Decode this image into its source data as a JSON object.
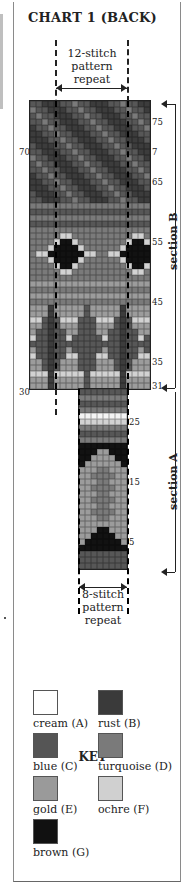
{
  "title": "CHART 1 (BACK)",
  "repeat_top": {
    "line1": "12-stitch",
    "line2": "pattern",
    "line3": "repeat"
  },
  "repeat_bottom": {
    "line1": "8-stitch",
    "line2": "pattern",
    "line3": "repeat"
  },
  "row_numbers": {
    "right": [
      {
        "label": "75",
        "row": 75
      },
      {
        "label": "7",
        "row": 70
      },
      {
        "label": "65",
        "row": 65
      },
      {
        "label": "55",
        "row": 55
      },
      {
        "label": "45",
        "row": 45
      },
      {
        "label": "35",
        "row": 35
      },
      {
        "label": "31",
        "row": 31
      },
      {
        "label": "25",
        "row": 25
      },
      {
        "label": "15",
        "row": 15
      },
      {
        "label": "5",
        "row": 5
      }
    ],
    "left": [
      {
        "label": "70",
        "row": 70
      },
      {
        "label": "30",
        "row": 30
      }
    ]
  },
  "sections": {
    "b": "section B",
    "a": "section A"
  },
  "key": {
    "title": "KEY",
    "items": [
      {
        "code": "A",
        "label": "cream (A)",
        "color": "#ffffff"
      },
      {
        "code": "B",
        "label": "rust (B)",
        "color": "#3a3a3a"
      },
      {
        "code": "C",
        "label": "blue (C)",
        "color": "#555555"
      },
      {
        "code": "D",
        "label": "turquoise (D)",
        "color": "#7a7a7a"
      },
      {
        "code": "E",
        "label": "gold (E)",
        "color": "#9a9a9a"
      },
      {
        "code": "F",
        "label": "ochre (F)",
        "color": "#d0d0d0"
      },
      {
        "code": "G",
        "label": "brown (G)",
        "color": "#111111"
      }
    ]
  },
  "colors": {
    "A": "#f4f4f4",
    "B": "#3c3c3c",
    "C": "#575757",
    "D": "#7a7a7a",
    "E": "#9c9c9c",
    "F": "#d2d2d2",
    "G": "#121212"
  },
  "chart_data": {
    "type": "table",
    "title": "CHART 1 (BACK)",
    "section_b": {
      "rows": [
        31,
        78
      ],
      "stitches": 20,
      "repeat": 12
    },
    "section_a": {
      "rows": [
        1,
        30
      ],
      "stitches": 8,
      "repeat": 8
    },
    "bands": [
      {
        "section": "A",
        "rows": [
          1,
          3
        ],
        "desc": "blue ground"
      },
      {
        "section": "A",
        "rows": [
          4,
          8
        ],
        "desc": "brown triangle on gold"
      },
      {
        "section": "A",
        "rows": [
          9,
          17
        ],
        "desc": "gold/turquoise chevron"
      },
      {
        "section": "A",
        "rows": [
          18,
          21
        ],
        "desc": "brown inverted chevron"
      },
      {
        "section": "A",
        "rows": [
          22,
          24
        ],
        "desc": "blue/turquoise"
      },
      {
        "section": "A",
        "rows": [
          25,
          26
        ],
        "desc": "ochre/cream stripe"
      },
      {
        "section": "A",
        "rows": [
          27,
          30
        ],
        "desc": "turquoise/blue"
      },
      {
        "section": "B",
        "rows": [
          31,
          44
        ],
        "desc": "rust/blue ogee shapes on gold"
      },
      {
        "section": "B",
        "rows": [
          45,
          49
        ],
        "desc": "turquoise/gold ground"
      },
      {
        "section": "B",
        "rows": [
          50,
          56
        ],
        "desc": "brown diamonds with ochre border"
      },
      {
        "section": "B",
        "rows": [
          57,
          61
        ],
        "desc": "turquoise/blue bands"
      },
      {
        "section": "B",
        "rows": [
          62,
          78
        ],
        "desc": "rust/blue diagonal stripes"
      }
    ]
  }
}
